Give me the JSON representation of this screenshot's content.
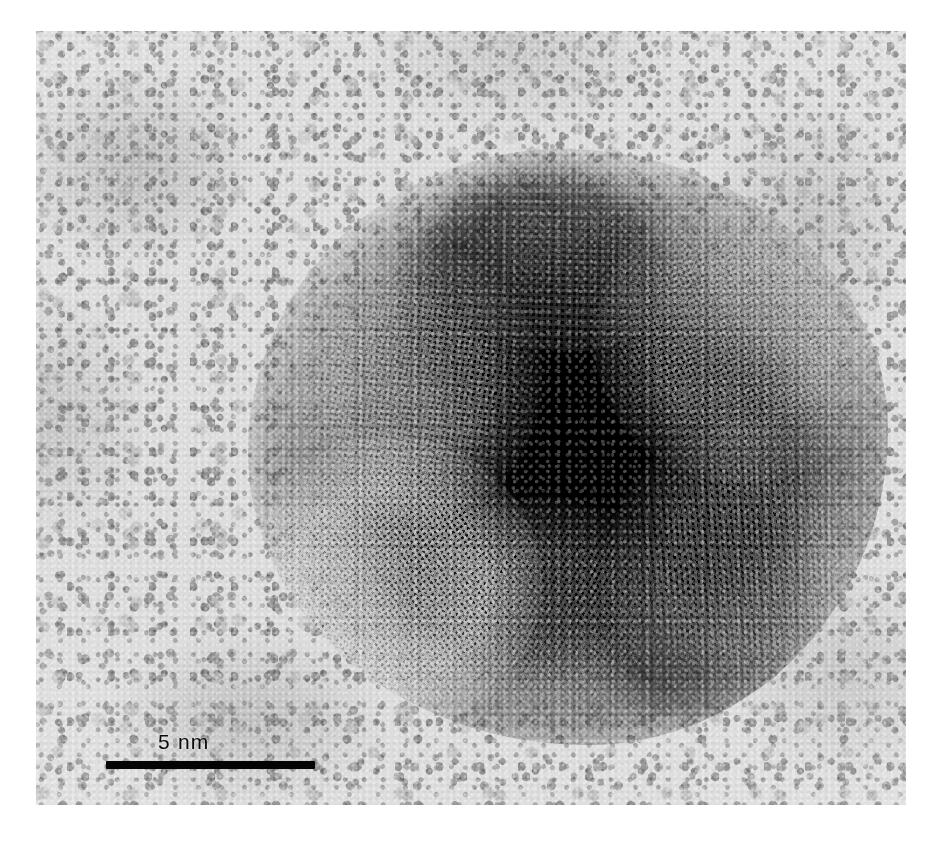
{
  "figure": {
    "type": "electron-micrograph",
    "modality": "HRTEM",
    "background_description": "mottled light-grey amorphous carbon support film",
    "colors": {
      "page_background": "#ffffff",
      "film_light": "#d8d8d8",
      "film_mid": "#9a9a9a",
      "particle_core": "#0a0a0a",
      "particle_rim": "#606060",
      "scale_bar": "#0b0b0b",
      "label_text": "#111111"
    }
  },
  "scale_bar": {
    "label": "5 nm",
    "value": 5,
    "unit": "nm",
    "bar_length_px": 209,
    "bar_thickness_px": 8,
    "position": "bottom-left"
  },
  "particle": {
    "shape": "quasi-spherical / multiply-twinned",
    "approx_diameter_nm": 15,
    "lattice_fringes_visible": true,
    "fringe_domains": 6,
    "contrast": "dark particle on light background"
  },
  "plate": {
    "left_px": 36,
    "top_px": 31,
    "width_px": 870,
    "height_px": 774
  }
}
